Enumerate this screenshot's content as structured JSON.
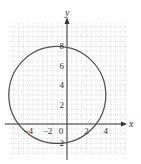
{
  "chart_data": {
    "type": "line",
    "title": "",
    "xlabel": "x",
    "ylabel": "y",
    "xlim": [
      -6,
      6.2
    ],
    "ylim": [
      -3.2,
      10.4
    ],
    "grid": true,
    "grid_step": 0.5,
    "x_ticks": [
      {
        "value": -4,
        "label": "−4"
      },
      {
        "value": -2,
        "label": "−2"
      },
      {
        "value": 0,
        "label": "0"
      },
      {
        "value": 2,
        "label": "2"
      },
      {
        "value": 4,
        "label": "4"
      }
    ],
    "y_ticks": [
      {
        "value": 8,
        "label": "8"
      },
      {
        "value": 6,
        "label": "6"
      },
      {
        "value": 4,
        "label": "4"
      },
      {
        "value": 2,
        "label": "2"
      },
      {
        "value": -2,
        "label": "−2"
      }
    ],
    "series": [
      {
        "name": "circle",
        "shape": "circle",
        "center": [
          -1,
          3
        ],
        "radius": 5,
        "equation": "(x + 1)^2 + (y - 3)^2 = 25",
        "key_points": [
          [
            -1,
            8
          ],
          [
            -1,
            -2
          ],
          [
            -6,
            3
          ],
          [
            4,
            3
          ]
        ]
      }
    ],
    "colors": {
      "curve": "#555555",
      "axis": "#333333",
      "grid": "#cfcfcf"
    }
  }
}
